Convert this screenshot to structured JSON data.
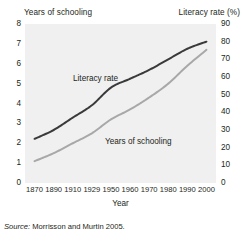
{
  "figure": {
    "left_axis_title": "Years of schooling",
    "right_axis_title": "Literacy rate (%)",
    "x_axis_label": "Year",
    "source_prefix": "Source:",
    "source_text": " Morrisson and Murtin 2005."
  },
  "labels": {
    "literacy": "Literacy rate",
    "schooling": "Years of schooling"
  },
  "chart_data": {
    "type": "line",
    "title": "",
    "xlabel": "Year",
    "ylabel": "Years of schooling",
    "y2label": "Literacy rate (%)",
    "grid": false,
    "legend": "inline-annotations",
    "plot_background": "#f0f0f0",
    "x": [
      1870,
      1890,
      1910,
      1929,
      1950,
      1960,
      1970,
      1980,
      1990,
      2000
    ],
    "xtick_labels": [
      "1870",
      "1890",
      "1910",
      "1929",
      "1950",
      "1960",
      "1970",
      "1980",
      "1990",
      "2000"
    ],
    "xlim": [
      1870,
      2000
    ],
    "ylim": [
      0,
      8
    ],
    "ytick_labels": [
      "0",
      "1",
      "2",
      "3",
      "4",
      "5",
      "6",
      "7",
      "8"
    ],
    "y2lim": [
      0,
      90
    ],
    "y2tick_labels": [
      "0",
      "10",
      "20",
      "30",
      "40",
      "50",
      "60",
      "70",
      "80",
      "90"
    ],
    "series": [
      {
        "name": "Literacy rate",
        "axis": "right",
        "unit": "%",
        "color": "#3a3a3a",
        "values": [
          25,
          30,
          37,
          44,
          54,
          59,
          64,
          70,
          76,
          80
        ]
      },
      {
        "name": "Years of schooling",
        "axis": "left",
        "unit": "years",
        "color": "#a8a8a8",
        "values": [
          1.1,
          1.5,
          2.0,
          2.5,
          3.2,
          3.7,
          4.3,
          5.0,
          5.9,
          6.7
        ]
      }
    ]
  }
}
